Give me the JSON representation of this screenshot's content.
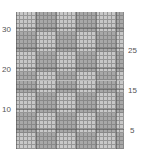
{
  "chart": {
    "type": "knitting-grid",
    "rows": 34,
    "cols": 27,
    "colors": {
      "light": "#c8c8c8",
      "dark": "#a8a8a8",
      "line": "#6e6e6e"
    }
  },
  "row_labels": {
    "left": [
      {
        "text": "30",
        "row": 30
      },
      {
        "text": "20",
        "row": 20
      },
      {
        "text": "10",
        "row": 10
      }
    ],
    "right": [
      {
        "text": "25",
        "row": 25
      },
      {
        "text": "15",
        "row": 15
      },
      {
        "text": "5",
        "row": 5
      }
    ]
  }
}
